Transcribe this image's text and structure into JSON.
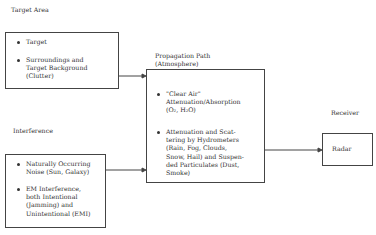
{
  "target_area": {
    "title": "Target Area",
    "items": [
      "Target",
      "Surroundings and\nTarget Background\n(Clutter)"
    ]
  },
  "interference": {
    "title": "Interference",
    "items": [
      "Naturally Occurring\nNoise (Sun, Galaxy)",
      "EM Interference,\nboth Intentional\n(Jamming) and\nUnintentional (EMI)"
    ]
  },
  "propagation": {
    "title": "Propagation Path\n(Atmosphere)",
    "items": [
      "\"Clear Air\"\nAttenuation/Absorption\n(O₂, H₂O)",
      "Attenuation and Scat-\ntering by Hydrometers\n(Rain, Fog, Clouds,\nSnow, Hail) and Suspen-\nded Particulates (Dust,\nSmoke)"
    ]
  },
  "receiver": {
    "title": "Receiver",
    "box_label": "Radar"
  }
}
